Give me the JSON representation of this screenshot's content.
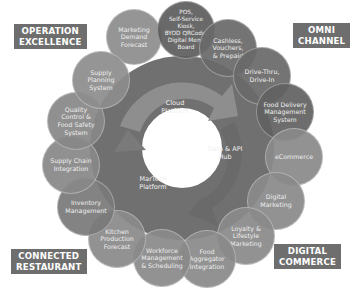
{
  "categories": {
    "operation_excellence": "OPERATION\nEXCELLENCE",
    "omni_channel": "OMNI\nCHANNEL",
    "connected_restaurant": "CONNECTED\nRESTAURANT",
    "digital_commerce": "DIGITAL\nCOMMERCE"
  },
  "core": {
    "segments": [
      {
        "label": "Cloud\nPlatform"
      },
      {
        "label": "Data & API\nHub"
      },
      {
        "label": "MarTech\nPlatform"
      }
    ]
  },
  "nodes": [
    {
      "label": "Marketing\nDemand\nForecast",
      "shade": "#8d8d8d"
    },
    {
      "label": "POS,\nSelf-Service\nKiosk,\nBYOD QRCode,\nDigital Menu\nBoard",
      "shade": "#5e5e5e"
    },
    {
      "label": "Cashless,\nVouchers,\n& Prepaid",
      "shade": "#6a6a6a"
    },
    {
      "label": "Drive-Thru,\nDrive-In",
      "shade": "#6a6a6a"
    },
    {
      "label": "Food Delivery\nManagement\nSystem",
      "shade": "#626262"
    },
    {
      "label": "eCommerce",
      "shade": "#8a8a8a"
    },
    {
      "label": "Digital\nMarketing",
      "shade": "#8a8a8a"
    },
    {
      "label": "Loyalty &\nLifestyle\nMarketing",
      "shade": "#8a8a8a"
    },
    {
      "label": "Food\nAggregator\nIntegration",
      "shade": "#8a8a8a"
    },
    {
      "label": "Workforce\nManagement\n& Scheduling",
      "shade": "#8a8a8a"
    },
    {
      "label": "Kitchen\nProduction\nForecast",
      "shade": "#8a8a8a"
    },
    {
      "label": "Inventory\nManagement",
      "shade": "#7a7a7a"
    },
    {
      "label": "Supply Chain\nIntegration",
      "shade": "#888888"
    },
    {
      "label": "Quality\nControl &\nFood Safety\nSystem",
      "shade": "#888888"
    },
    {
      "label": "Supply\nPlanning\nSystem",
      "shade": "#8d8d8d"
    }
  ],
  "colors": {
    "tag_bg": "#6e6e6e",
    "ring_light": "#8a8a8a",
    "ring_dark": "#666666",
    "ring_mid": "#767676"
  }
}
